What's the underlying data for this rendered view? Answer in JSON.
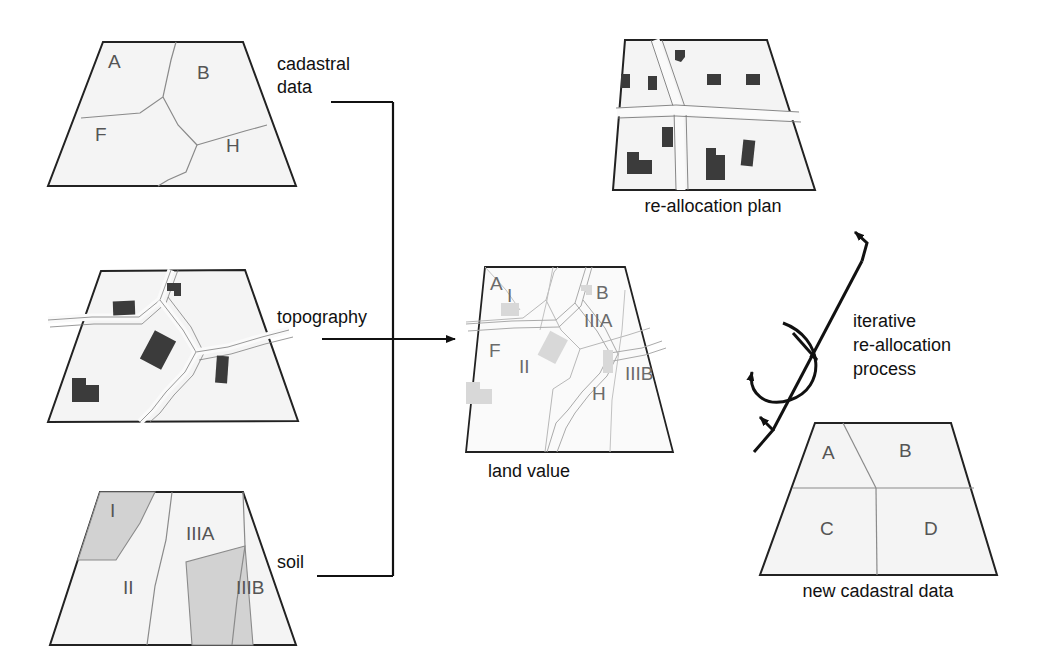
{
  "diagram": {
    "colors": {
      "parcel_fill": "#f4f4f4",
      "soil_shaded_fill": "#d2d2d2",
      "building_dark": "#3b3b3b",
      "building_faint": "#d8d8d8",
      "outline": "#222222",
      "inner_line": "#8a8a8a",
      "road_line": "#7a7a7a",
      "faint_line": "#b8b8b8",
      "text": "#111111",
      "label_text": "#555555",
      "background": "#ffffff"
    },
    "panels": [
      {
        "id": "cadastral",
        "caption": "",
        "connector_label": "cadastral\ndata",
        "connector_label_lines": [
          "cadastral",
          "data"
        ],
        "parcels": [
          {
            "code": "A"
          },
          {
            "code": "B"
          },
          {
            "code": "F"
          },
          {
            "code": "H"
          }
        ]
      },
      {
        "id": "topography",
        "caption": "",
        "connector_label": "topography",
        "connector_label_lines": [
          "topography"
        ],
        "feature_note": "roads and buildings",
        "building_count": 5,
        "parcels": []
      },
      {
        "id": "soil",
        "caption": "",
        "connector_label": "soil",
        "connector_label_lines": [
          "soil"
        ],
        "parcels": [
          {
            "code": "I",
            "shaded": true
          },
          {
            "code": "II",
            "shaded": false
          },
          {
            "code": "IIIA",
            "shaded": false
          },
          {
            "code": "IIIB",
            "shaded": true
          }
        ]
      },
      {
        "id": "land-value",
        "caption": "land value",
        "connector_label": "",
        "parcels": [
          {
            "code": "A"
          },
          {
            "code": "I"
          },
          {
            "code": "B"
          },
          {
            "code": "IIIA"
          },
          {
            "code": "F"
          },
          {
            "code": "II"
          },
          {
            "code": "H"
          },
          {
            "code": "IIIB"
          }
        ]
      },
      {
        "id": "reallocation-plan",
        "caption": "re-allocation plan",
        "connector_label": "",
        "building_count": 9,
        "parcels": []
      },
      {
        "id": "new-cadastral",
        "caption": "new cadastral data",
        "connector_label": "",
        "parcels": [
          {
            "code": "A"
          },
          {
            "code": "B"
          },
          {
            "code": "C"
          },
          {
            "code": "D"
          }
        ]
      }
    ],
    "process": {
      "label_lines": [
        "iterative",
        "re-allocation",
        "process"
      ],
      "label_full": "iterative re-allocation process"
    },
    "labels": {
      "cadastral_line1": "cadastral",
      "cadastral_line2": "data",
      "topography": "topography",
      "soil": "soil",
      "land_value_caption": "land value",
      "reallocation_caption": "re-allocation plan",
      "new_cadastral_caption": "new cadastral data",
      "process_line1": "iterative",
      "process_line2": "re-allocation",
      "process_line3": "process",
      "cadastral_A": "A",
      "cadastral_B": "B",
      "cadastral_F": "F",
      "cadastral_H": "H",
      "soil_I": "I",
      "soil_II": "II",
      "soil_IIIA": "IIIA",
      "soil_IIIB": "IIIB",
      "lv_A": "A",
      "lv_I": "I",
      "lv_B": "B",
      "lv_IIIA": "IIIA",
      "lv_F": "F",
      "lv_II": "II",
      "lv_H": "H",
      "lv_IIIB": "IIIB",
      "nc_A": "A",
      "nc_B": "B",
      "nc_C": "C",
      "nc_D": "D"
    }
  }
}
